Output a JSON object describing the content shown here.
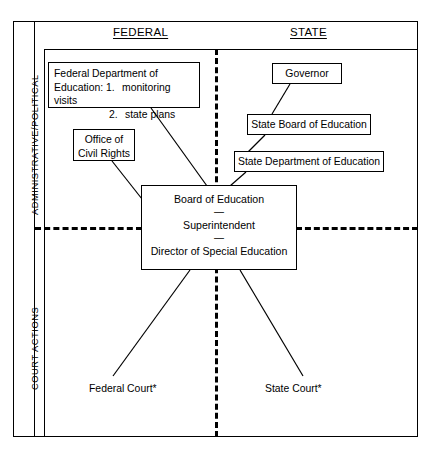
{
  "diagram": {
    "column_headers": {
      "federal": "FEDERAL",
      "state": "STATE"
    },
    "row_labels": {
      "administrative": "ADMINISTRATIVE/POLITICAL",
      "court": "COURT ACTIONS"
    },
    "nodes": {
      "federal_doe": {
        "line1": "Federal Department of",
        "line2_prefix": "Education:",
        "item1_num": "1.",
        "item1_text": "monitoring visits",
        "item2_num": "2.",
        "item2_text": "state plans"
      },
      "office_civil_rights": {
        "line1": "Office of",
        "line2": "Civil Rights"
      },
      "governor": "Governor",
      "state_board_of_education": "State Board of Education",
      "state_department_of_education": "State Department of Education",
      "local_board": {
        "row1": "Board of Education",
        "separator1": "—",
        "row2": "Superintendent",
        "separator2": "—",
        "row3": "Director of Special Education"
      },
      "federal_court": "Federal Court*",
      "state_court": "State Court*"
    },
    "colors": {
      "stroke": "#000000",
      "background": "#ffffff"
    }
  }
}
